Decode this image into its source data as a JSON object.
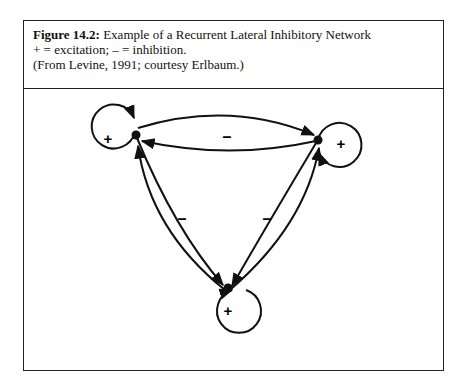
{
  "figure": {
    "label": "Figure 14.2:",
    "title": "Example of a Recurrent Lateral Inhibitory Network",
    "legend": "+ = excitation; – = inhibition.",
    "source": "(From Levine, 1991; courtesy Erlbaum.)"
  },
  "diagram": {
    "nodes": [
      {
        "id": "left",
        "self_connection": "+"
      },
      {
        "id": "right",
        "self_connection": "+"
      },
      {
        "id": "bottom",
        "self_connection": "+"
      }
    ],
    "edges": [
      {
        "between": [
          "left",
          "right"
        ],
        "label": "–"
      },
      {
        "between": [
          "left",
          "bottom"
        ],
        "label": "–"
      },
      {
        "between": [
          "right",
          "bottom"
        ],
        "label": "–"
      }
    ]
  }
}
